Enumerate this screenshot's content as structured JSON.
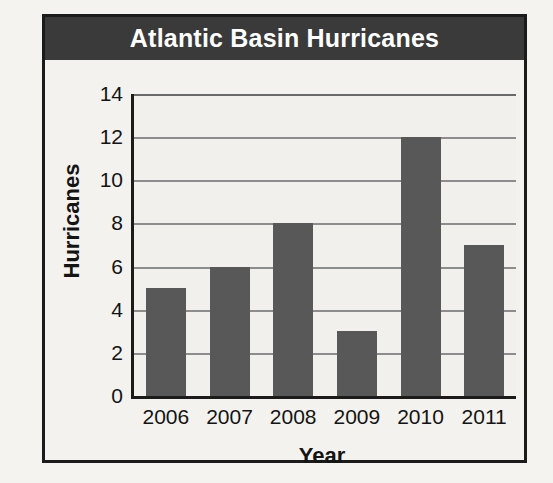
{
  "chart_data": {
    "type": "bar",
    "title": "Atlantic Basin Hurricanes",
    "xlabel": "Year",
    "ylabel": "Hurricanes",
    "categories": [
      "2006",
      "2007",
      "2008",
      "2009",
      "2010",
      "2011"
    ],
    "values": [
      5,
      6,
      8,
      3,
      12,
      7
    ],
    "ylim": [
      0,
      14
    ],
    "ytick_labels": [
      "0",
      "2",
      "4",
      "6",
      "8",
      "10",
      "12",
      "14"
    ],
    "ytick_values": [
      0,
      2,
      4,
      6,
      8,
      10,
      12,
      14
    ],
    "grid": true,
    "legend": "none",
    "colors": {
      "bar": "#585858",
      "title_band": "#3a3a3a",
      "title_text": "#ffffff",
      "gridline": "#8d8d8d",
      "axis": "#1b1b1b",
      "plot_background": "#f1f0ec",
      "page_background": "#f4f3ef"
    }
  }
}
